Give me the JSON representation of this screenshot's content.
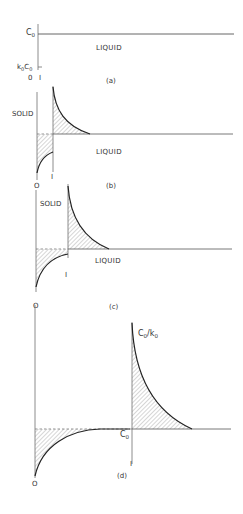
{
  "figure": {
    "panels": [
      {
        "id": "a",
        "caption": "(a)",
        "labels": {
          "c0": "C",
          "c0_sub": "0",
          "k0c0_k": "k",
          "k0c0_sub1": "0",
          "k0c0_c": "C",
          "k0c0_sub2": "0",
          "liquid": "LIQUID",
          "origin": "0",
          "interface": "I"
        }
      },
      {
        "id": "b",
        "caption": "(b)",
        "labels": {
          "solid": "SOLID",
          "liquid": "LIQUID",
          "interface": "I",
          "origin": "O"
        }
      },
      {
        "id": "c",
        "caption": "(c)",
        "labels": {
          "solid": "SOLID",
          "liquid": "LIQUID",
          "interface": "I",
          "origin": "O"
        }
      },
      {
        "id": "d",
        "caption": "(d)",
        "labels": {
          "peak_c": "C",
          "peak_sub1": "0",
          "peak_slash": "/",
          "peak_k": "k",
          "peak_sub2": "0",
          "c0": "C",
          "c0_sub": "0",
          "interface": "I",
          "origin": "O"
        }
      }
    ]
  },
  "colors": {
    "line": "#222222",
    "axis": "#6f6f6f",
    "hatch": "#888888",
    "text": "#333333"
  }
}
